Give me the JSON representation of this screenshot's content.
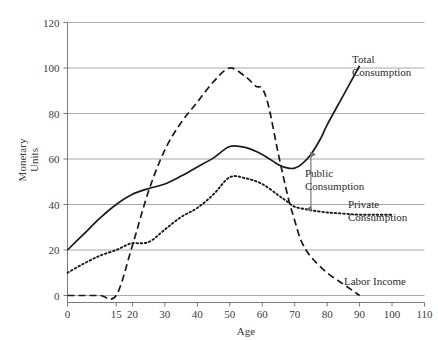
{
  "chart_data": {
    "type": "line",
    "title": "",
    "xlabel": "Age",
    "ylabel": "Monetary Units",
    "xlim": [
      0,
      110
    ],
    "ylim": [
      0,
      120
    ],
    "grid": "horizontal",
    "legend_position": "inline-right-of-curve-ends",
    "x_ticks": [
      "0",
      "15",
      "20",
      "30",
      "40",
      "50",
      "60",
      "70",
      "80",
      "90",
      "100",
      "110"
    ],
    "x_tick_values": [
      0,
      15,
      20,
      30,
      40,
      50,
      60,
      70,
      80,
      90,
      100,
      110
    ],
    "y_ticks": [
      "0",
      "20",
      "40",
      "60",
      "80",
      "100",
      "120"
    ],
    "y_tick_values": [
      0,
      20,
      40,
      60,
      80,
      100,
      120
    ],
    "series": [
      {
        "name": "Total Consumption",
        "style": "solid",
        "color": "#1a1a1a",
        "x": [
          0,
          5,
          10,
          15,
          20,
          25,
          30,
          35,
          40,
          45,
          50,
          55,
          60,
          65,
          68,
          70,
          72,
          75,
          78,
          80,
          85,
          90
        ],
        "values": [
          20,
          27,
          34,
          40,
          44.5,
          47,
          49,
          52.5,
          56.5,
          60.5,
          65.5,
          65,
          62,
          57.5,
          56,
          56,
          57.5,
          62,
          69,
          75,
          88,
          101
        ]
      },
      {
        "name": "Private Consumption",
        "style": "dotted",
        "color": "#1a1a1a",
        "x": [
          0,
          5,
          10,
          15,
          18,
          20,
          25,
          30,
          35,
          40,
          45,
          50,
          55,
          60,
          65,
          68,
          70,
          75,
          80,
          85,
          90,
          95,
          100
        ],
        "values": [
          10,
          14,
          17.5,
          20,
          22,
          23,
          23.5,
          29,
          34.5,
          38.5,
          44.5,
          52,
          51.5,
          49,
          44,
          41,
          39,
          37.5,
          36.5,
          36,
          35.5,
          35.5,
          35.5
        ]
      },
      {
        "name": "Labor Income",
        "style": "dashed",
        "color": "#1a1a1a",
        "x": [
          0,
          5,
          10,
          15,
          20,
          25,
          30,
          35,
          40,
          45,
          50,
          55,
          58,
          60,
          62,
          65,
          68,
          70,
          72,
          75,
          80,
          85,
          88,
          90
        ],
        "values": [
          0,
          0,
          0,
          0,
          22,
          46,
          64,
          76,
          85,
          94,
          100,
          96,
          92,
          91,
          83,
          62,
          43,
          33,
          24,
          17,
          10,
          5,
          2,
          0
        ]
      }
    ],
    "annotations": [
      {
        "id": "public-consumption",
        "label_lines": [
          "Public",
          "Consumption"
        ],
        "type": "double-headed-arrow",
        "at_x": 75,
        "from_y": 62,
        "to_y": 38
      }
    ],
    "series_labels": [
      {
        "id": "total-consumption",
        "lines": [
          "Total",
          "Consumption"
        ]
      },
      {
        "id": "private-consumption",
        "lines": [
          "Private",
          "Consumption"
        ]
      },
      {
        "id": "labor-income",
        "lines": [
          "Labor Income"
        ]
      }
    ],
    "colors": {
      "line": "#1a1a1a",
      "gridline": "#a8a8a8",
      "axis": "#7a7a7a",
      "text": "#2b2b2b",
      "background": "#ffffff"
    }
  }
}
